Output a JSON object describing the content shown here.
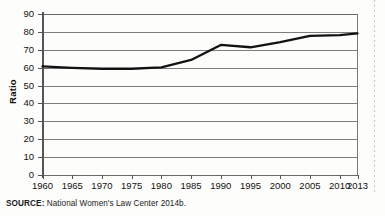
{
  "figure": {
    "source_label": "SOURCE:",
    "source_text": " National Women's Law Center 2014b."
  },
  "chart_data": {
    "type": "line",
    "title": "",
    "xlabel": "",
    "ylabel": "Ratio",
    "categories": [
      "1960",
      "1965",
      "1970",
      "1975",
      "1980",
      "1985",
      "1990",
      "1995",
      "2000",
      "2005",
      "2010",
      "2013"
    ],
    "x": [
      1960,
      1965,
      1970,
      1975,
      1980,
      1985,
      1990,
      1995,
      2000,
      2005,
      2010,
      2013
    ],
    "values": [
      60.7,
      59.9,
      59.4,
      59.4,
      60.2,
      64.3,
      72.7,
      71.4,
      74.3,
      77.8,
      78.2,
      79.2
    ],
    "series": [
      {
        "name": "Ratio",
        "values": [
          60.7,
          59.9,
          59.4,
          59.4,
          60.2,
          64.3,
          72.7,
          71.4,
          74.3,
          77.8,
          78.2,
          79.2
        ]
      }
    ],
    "ylim": [
      0,
      90
    ],
    "yticks": [
      0,
      10,
      20,
      30,
      40,
      50,
      60,
      70,
      80,
      90
    ],
    "ytick_labels": [
      "0",
      "10",
      "20",
      "30",
      "40",
      "50",
      "60",
      "70",
      "80",
      "90"
    ],
    "xlim": [
      1960,
      2013
    ],
    "grid": "horizontal",
    "legend": "none",
    "line_color": "#121212",
    "grid_color": "#7d7d7d",
    "background_color": "#fdfdfb"
  }
}
